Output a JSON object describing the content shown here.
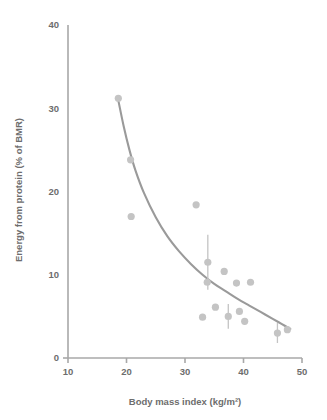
{
  "chart_data": {
    "type": "scatter",
    "title": "",
    "xlabel": "Body mass index (kg/m²)",
    "ylabel": "Energy from protein (% of BMR)",
    "xlim": [
      10,
      50
    ],
    "ylim": [
      0,
      40
    ],
    "xticks": [
      10,
      20,
      30,
      40,
      50
    ],
    "yticks": [
      0,
      10,
      20,
      30,
      40
    ],
    "xtick_labels": [
      "10",
      "20",
      "30",
      "40",
      "50"
    ],
    "ytick_labels": [
      "0",
      "10",
      "20",
      "30",
      "40"
    ],
    "grid": false,
    "legend": null,
    "marker_color": "#c4c4c4",
    "curve_color": "#9a9a9a",
    "axis_color": "#a8a8a8",
    "text_color": "#6d6d6d",
    "points": [
      {
        "x": 18.6,
        "y": 31.2,
        "yerr": 0
      },
      {
        "x": 20.7,
        "y": 23.8,
        "yerr": 0
      },
      {
        "x": 20.8,
        "y": 17.0,
        "yerr": 0
      },
      {
        "x": 31.9,
        "y": 18.4,
        "yerr": 0
      },
      {
        "x": 33.9,
        "y": 11.5,
        "yerr": 3.3
      },
      {
        "x": 33.8,
        "y": 9.1,
        "yerr": 0
      },
      {
        "x": 36.7,
        "y": 10.4,
        "yerr": 0
      },
      {
        "x": 38.8,
        "y": 9.0,
        "yerr": 0
      },
      {
        "x": 41.2,
        "y": 9.1,
        "yerr": 0
      },
      {
        "x": 35.2,
        "y": 6.1,
        "yerr": 0
      },
      {
        "x": 39.3,
        "y": 5.6,
        "yerr": 0
      },
      {
        "x": 33.0,
        "y": 4.9,
        "yerr": 0
      },
      {
        "x": 37.4,
        "y": 5.0,
        "yerr": 1.5
      },
      {
        "x": 40.2,
        "y": 4.4,
        "yerr": 0
      },
      {
        "x": 45.8,
        "y": 3.0,
        "yerr": 1.2
      },
      {
        "x": 47.5,
        "y": 3.4,
        "yerr": 0
      }
    ],
    "fit_curve": {
      "description": "decreasing power-law fit",
      "x_start": 18.5,
      "x_end": 48.0,
      "points": [
        {
          "x": 18.5,
          "y": 31.3
        },
        {
          "x": 19.5,
          "y": 27.9
        },
        {
          "x": 20.5,
          "y": 25.0
        },
        {
          "x": 21.5,
          "y": 22.6
        },
        {
          "x": 23.0,
          "y": 19.8
        },
        {
          "x": 25.0,
          "y": 16.9
        },
        {
          "x": 27.0,
          "y": 14.6
        },
        {
          "x": 29.0,
          "y": 12.8
        },
        {
          "x": 31.0,
          "y": 11.3
        },
        {
          "x": 33.0,
          "y": 10.0
        },
        {
          "x": 35.0,
          "y": 8.9
        },
        {
          "x": 37.0,
          "y": 8.0
        },
        {
          "x": 39.0,
          "y": 7.1
        },
        {
          "x": 41.0,
          "y": 6.3
        },
        {
          "x": 43.0,
          "y": 5.5
        },
        {
          "x": 45.0,
          "y": 4.7
        },
        {
          "x": 46.5,
          "y": 4.1
        },
        {
          "x": 48.0,
          "y": 3.5
        }
      ]
    }
  }
}
